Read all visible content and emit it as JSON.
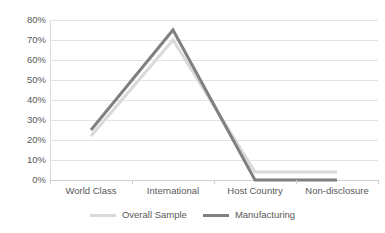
{
  "chart_data": {
    "type": "line",
    "title": "",
    "subtitle": "",
    "xlabel": "",
    "ylabel": "",
    "categories": [
      "World Class",
      "International",
      "Host Country",
      "Non-disclosure"
    ],
    "series": [
      {
        "name": "Overall Sample",
        "color": "#d9d9d9",
        "values": [
          22,
          70,
          4,
          4
        ],
        "value_labels": [
          "22%",
          "70%",
          "4%",
          "4%"
        ]
      },
      {
        "name": "Manufacturing",
        "color": "#808080",
        "values": [
          25,
          75,
          0,
          0
        ],
        "value_labels": [
          "25%",
          "75%",
          "0%",
          "0%"
        ]
      }
    ],
    "ylim": [
      0,
      80
    ],
    "ytick_values": [
      0,
      10,
      20,
      30,
      40,
      50,
      60,
      70,
      80
    ],
    "ytick_labels": [
      "0%",
      "10%",
      "20%",
      "30%",
      "40%",
      "50%",
      "60%",
      "70%",
      "80%"
    ],
    "grid": true,
    "grid_axis": "y",
    "legend_position": "bottom",
    "legend_entries": [
      "Overall Sample",
      "Manufacturing"
    ],
    "annotations": [],
    "background_color": "#ffffff",
    "gridline_color": "#e3e3e3",
    "axis_text_color": "#595959"
  }
}
